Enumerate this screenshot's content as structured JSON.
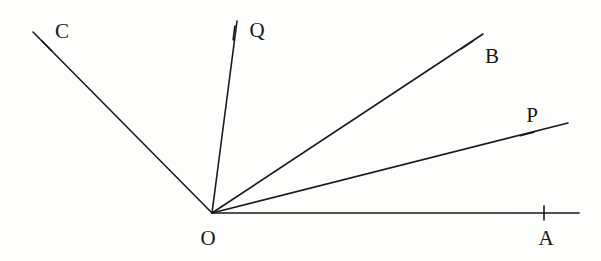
{
  "figure": {
    "kind": "geometry-diagram",
    "background_color": "#fdfdfc",
    "line_color": "#1a1a1a",
    "label_color": "#171717",
    "width": 601,
    "height": 261
  },
  "vertex": {
    "name": "O",
    "label": "O",
    "x": 212,
    "y": 213,
    "label_x": 208,
    "label_y": 238
  },
  "rays": [
    {
      "id": "ray-OC",
      "label": "C",
      "from_x": 212,
      "from_y": 213,
      "to_x": 33,
      "to_y": 32,
      "tick_x": 47,
      "tick_y": 46,
      "tick_angle_deg": 45,
      "label_x": 62,
      "label_y": 31
    },
    {
      "id": "ray-OQ",
      "label": "Q",
      "from_x": 212,
      "from_y": 213,
      "to_x": 237,
      "to_y": 21,
      "tick_x": 234,
      "tick_y": 33,
      "tick_angle_deg": 97,
      "label_x": 257,
      "label_y": 30
    },
    {
      "id": "ray-OB",
      "label": "B",
      "from_x": 212,
      "from_y": 213,
      "to_x": 483,
      "to_y": 34,
      "tick_x": 467,
      "tick_y": 45,
      "tick_angle_deg": 146,
      "label_x": 492,
      "label_y": 56
    },
    {
      "id": "ray-OP",
      "label": "P",
      "from_x": 212,
      "from_y": 213,
      "to_x": 568,
      "to_y": 123,
      "tick_x": 527,
      "tick_y": 134,
      "tick_angle_deg": 166,
      "label_x": 532,
      "label_y": 115
    },
    {
      "id": "ray-OA",
      "label": "A",
      "from_x": 212,
      "from_y": 213,
      "to_x": 579,
      "to_y": 213,
      "tick_x": 544,
      "tick_y": 213,
      "tick_angle_deg": 90,
      "label_x": 546,
      "label_y": 238
    }
  ],
  "tick_half_length": 7
}
